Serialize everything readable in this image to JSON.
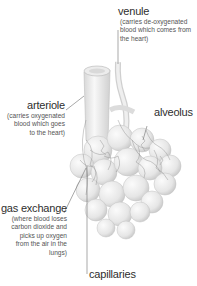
{
  "diagram": {
    "labels": {
      "venule": {
        "term": "venule",
        "desc_lines": [
          "(carries de-oxygenated",
          "blood which comes from",
          "the heart)"
        ]
      },
      "arteriole": {
        "term": "arteriole",
        "desc_lines": [
          "(carries oxygenated",
          "blood which goes",
          "to the heart)"
        ]
      },
      "alveolus": {
        "term": "alveolus"
      },
      "gas_exchange": {
        "term": "gas exchange",
        "desc_lines": [
          "(where blood loses",
          "carbon dioxide and",
          "picks up oxygen",
          "from the air in the",
          "lungs)"
        ]
      },
      "capillaries": {
        "term": "capillaries"
      }
    },
    "colors": {
      "background": "#ffffff",
      "tissue_light": "#f2f2f2",
      "tissue_shadow": "#c8c8c8",
      "vessel_lines": "#8a8a8a",
      "leader_lines": "#666666",
      "text": "#333333"
    }
  }
}
